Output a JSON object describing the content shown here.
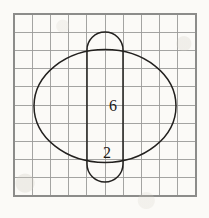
{
  "figure": {
    "background_color": "#fbfaf7",
    "grid": {
      "columns": 10,
      "rows": 10,
      "cell_size": 18.2,
      "origin_x": 14,
      "origin_y": 14,
      "line_color": "#9a9a98",
      "frame_color": "#8c8c8a"
    },
    "shapes": [
      {
        "name": "ellipse",
        "type": "ellipse",
        "cx": 105,
        "cy": 106,
        "rx": 71,
        "ry": 56.5,
        "stroke_color": "#22201e"
      },
      {
        "name": "capsule",
        "type": "stadium",
        "x": 87,
        "y": 32,
        "width": 36,
        "height": 150,
        "radius": 18,
        "stroke_color": "#22201e"
      }
    ],
    "labels": [
      {
        "name": "label-six",
        "text": "6",
        "x": 113,
        "y": 111
      },
      {
        "name": "label-two",
        "text": "2",
        "x": 107,
        "y": 158
      }
    ]
  }
}
